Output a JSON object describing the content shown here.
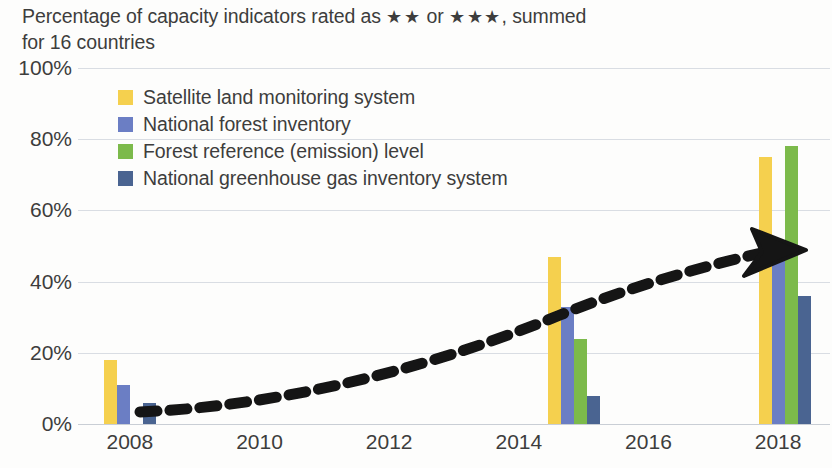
{
  "chart_data": {
    "type": "bar",
    "title_line1_pre": "Percentage of capacity indicators rated as ",
    "title_stars_a": "★★",
    "title_mid": " or ",
    "title_stars_b": "★★★",
    "title_line1_post": ", summed",
    "title_line2": "for 16 countries",
    "xlabel": "",
    "ylabel": "",
    "ylim": [
      0,
      100
    ],
    "xlim": [
      2007.2,
      2018.8
    ],
    "grid": true,
    "legend_position": "inside-top-left",
    "y_ticks": [
      "0%",
      "20%",
      "40%",
      "60%",
      "80%",
      "100%"
    ],
    "y_tick_values": [
      0,
      20,
      40,
      60,
      80,
      100
    ],
    "x_ticks": [
      "2008",
      "2010",
      "2012",
      "2014",
      "2016",
      "2018"
    ],
    "x_tick_values": [
      2008,
      2010,
      2012,
      2014,
      2016,
      2018
    ],
    "categories": [
      "2008",
      "2015",
      "2018"
    ],
    "category_x": [
      2008,
      2014.85,
      2018.1
    ],
    "series": [
      {
        "name": "Satellite land monitoring system",
        "color": "#f5d04e",
        "values": [
          18,
          47,
          75
        ]
      },
      {
        "name": "National forest inventory",
        "color": "#6b7ec4",
        "values": [
          11,
          33,
          46
        ]
      },
      {
        "name": "Forest reference (emission) level",
        "color": "#7cba4b",
        "values": [
          0,
          24,
          78
        ]
      },
      {
        "name": "National greenhouse gas inventory system",
        "color": "#4a6491",
        "values": [
          6,
          8,
          36
        ]
      }
    ],
    "annotations": [
      {
        "type": "arrow",
        "style": "thick-dashed-curved",
        "color": "#151515",
        "label": "upward trend arrow",
        "start": [
          2008.7,
          6
        ],
        "end": [
          2017.6,
          48
        ]
      }
    ]
  },
  "legend": {
    "items": [
      {
        "label": "Satellite land monitoring system",
        "color": "#f5d04e"
      },
      {
        "label": "National forest inventory",
        "color": "#6b7ec4"
      },
      {
        "label": "Forest reference (emission) level",
        "color": "#7cba4b"
      },
      {
        "label": "National greenhouse gas inventory system",
        "color": "#4a6491"
      }
    ]
  }
}
